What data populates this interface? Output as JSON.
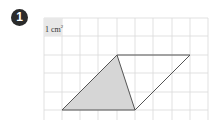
{
  "problem": {
    "number": "1",
    "unit_label": "1 cm",
    "unit_exponent": "2"
  },
  "grid": {
    "x_lines": [
      44,
      62,
      80,
      98,
      117,
      135,
      153,
      172,
      190,
      208
    ],
    "y_lines": [
      18,
      36,
      55,
      73,
      92,
      110
    ],
    "line_color": "#d9d9d9"
  },
  "shapes": {
    "parallelogram": [
      [
        62,
        110
      ],
      [
        117,
        55
      ],
      [
        190,
        55
      ],
      [
        135,
        110
      ]
    ],
    "shaded_triangle": [
      [
        62,
        110
      ],
      [
        117,
        55
      ],
      [
        135,
        110
      ]
    ],
    "shade_color": "#d6d6d6",
    "stroke_color": "#555555"
  }
}
